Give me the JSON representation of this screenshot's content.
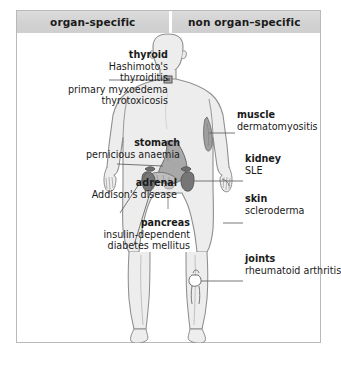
{
  "figure": {
    "title_alt": "Organ-specific and non organ-specific autoimmune diseases",
    "columns": {
      "left_header": "organ-specific",
      "right_header": "non organ–specific"
    },
    "colors": {
      "frame_border": "#b9b9b9",
      "header_band": "#d5d5d5",
      "body_fill": "#ededed",
      "body_outline": "#8e8e8e",
      "organ_dark": "#6f6f6f",
      "organ_mid": "#9a9a9a",
      "leader_line": "#6a6a6a",
      "text": "#1a1a1a"
    },
    "organ_specific": [
      {
        "term": "thyroid",
        "diseases": [
          "Hashimoto's",
          "thyroiditis",
          "primary myxoedema",
          "thyrotoxicosis"
        ],
        "marker": "thyroid-gland-marker"
      },
      {
        "term": "stomach",
        "diseases": [
          "pernicious anaemia"
        ],
        "marker": "stomach-organ-marker"
      },
      {
        "term": "adrenal",
        "diseases": [
          "Addison's disease"
        ],
        "marker": "adrenal-gland-marker"
      },
      {
        "term": "pancreas",
        "diseases": [
          "insulin-dependent",
          "diabetes mellitus"
        ],
        "marker": "pancreas-organ-marker"
      }
    ],
    "non_organ_specific": [
      {
        "term": "muscle",
        "diseases": [
          "dermatomyositis"
        ],
        "marker": "arm-muscle-marker"
      },
      {
        "term": "kidney",
        "diseases": [
          "SLE"
        ],
        "marker": "kidney-organ-marker"
      },
      {
        "term": "skin",
        "diseases": [
          "scleroderma"
        ],
        "marker": "hand-skin-marker"
      },
      {
        "term": "joints",
        "diseases": [
          "rheumatoid arthritis"
        ],
        "marker": "knee-joint-marker"
      }
    ]
  }
}
